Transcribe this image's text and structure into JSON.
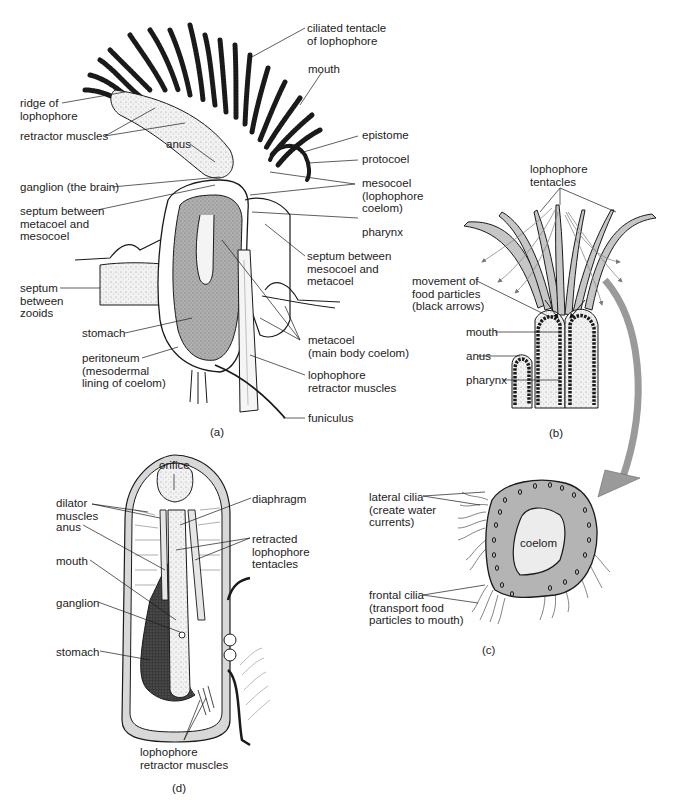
{
  "figure": {
    "colors": {
      "ink": "#1a1a1a",
      "stipple_gray": "#a9a9a9",
      "tentacle_gray": "#c4c4c4",
      "body_gray": "#b2b2b2",
      "coelom_light": "#e8e8e8",
      "arrow_gray": "#9a9a9a",
      "background": "#ffffff"
    },
    "panel_a": {
      "letter": "(a)",
      "labels": {
        "ciliated_tentacle": "ciliated tentacle\nof lophophore",
        "mouth": "mouth",
        "ridge": "ridge of\nlophophore",
        "retractor_muscles": "retractor muscles",
        "anus": "anus",
        "epistome": "epistome",
        "protocoel": "protocoel",
        "ganglion": "ganglion (the brain)",
        "mesocoel": "mesocoel\n(lophophore\ncoelom)",
        "septum_meta_meso": "septum between\nmetacoel and\nmesocoel",
        "pharynx": "pharynx",
        "septum_meso_meta": "septum between\nmesocoel and\nmetacoel",
        "septum_zooids": "septum\nbetween\nzooids",
        "stomach": "stomach",
        "metacoel": "metacoel\n(main body coelom)",
        "peritoneum": "peritoneum\n(mesodermal\nlining of coelom)",
        "lophophore_retractor": "lophophore\nretractor muscles",
        "funiculus": "funiculus"
      }
    },
    "panel_b": {
      "letter": "(b)",
      "labels": {
        "lophophore_tentacles": "lophophore\ntentacles",
        "movement": "movement of\nfood particles\n(black arrows)",
        "mouth": "mouth",
        "anus": "anus",
        "pharynx": "pharynx"
      }
    },
    "panel_c": {
      "letter": "(c)",
      "labels": {
        "lateral_cilia": "lateral cilia\n(create water\ncurrents)",
        "coelom": "coelom",
        "frontal_cilia": "frontal cilia\n(transport food\nparticles to mouth)"
      }
    },
    "panel_d": {
      "letter": "(d)",
      "labels": {
        "orifice": "orifice",
        "dilator_muscles": "dilator\nmuscles",
        "diaphragm": "diaphragm",
        "anus": "anus",
        "retracted_tentacles": "retracted\nlophophore\ntentacles",
        "mouth": "mouth",
        "ganglion": "ganglion",
        "stomach": "stomach",
        "lophophore_retractor": "lophophore\nretractor muscles"
      }
    }
  }
}
